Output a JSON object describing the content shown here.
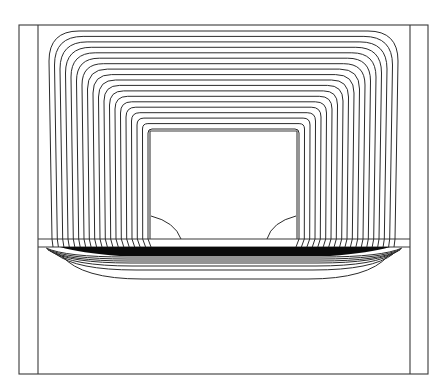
{
  "figure": {
    "type": "flux-contour-diagram",
    "width": 445,
    "height": 389,
    "colors": {
      "background": "#ffffff",
      "line": "#2b2b2b",
      "frame": "#3a3a3a",
      "band": "#0a0a0a"
    },
    "outer_frame": {
      "x1": 19,
      "y1": 25,
      "x2": 428,
      "y2": 374
    },
    "inner_verticals": {
      "left_x": 38,
      "right_x": 410
    },
    "window": {
      "x1": 150,
      "y1": 131,
      "x2": 297,
      "y2": 239
    },
    "divider_line_y": 239,
    "plate": {
      "x1": 38,
      "y1": 247,
      "x2": 410,
      "y2": 374
    },
    "upper_contours": {
      "count": 19,
      "outer": {
        "x1": 49,
        "y1": 31,
        "x2": 398,
        "corner_r": 30
      },
      "inner": {
        "x1": 148,
        "y1": 129,
        "x2": 299,
        "corner_r": 4
      },
      "bottom_y": 239
    },
    "band": {
      "x1": 120,
      "y1": 247,
      "x2": 330,
      "y2": 256
    },
    "lower_contours": [
      {
        "y_center": 257,
        "x_left": 46,
        "x_right": 402,
        "y_edge": 248
      },
      {
        "y_center": 259,
        "x_left": 47,
        "x_right": 401,
        "y_edge": 249
      },
      {
        "y_center": 261,
        "x_left": 48,
        "x_right": 400,
        "y_edge": 250
      },
      {
        "y_center": 263,
        "x_left": 50,
        "x_right": 398,
        "y_edge": 251
      },
      {
        "y_center": 266,
        "x_left": 52,
        "x_right": 396,
        "y_edge": 252
      },
      {
        "y_center": 270,
        "x_left": 56,
        "x_right": 393,
        "y_edge": 254
      },
      {
        "y_center": 279,
        "x_left": 62,
        "x_right": 388,
        "y_edge": 256
      }
    ],
    "lobes": [
      {
        "side": "left",
        "start": [
          151,
          216
        ],
        "ctrl": [
          175,
          222
        ],
        "end": [
          181,
          239
        ]
      },
      {
        "side": "right",
        "start": [
          296,
          216
        ],
        "ctrl": [
          272,
          222
        ],
        "end": [
          267,
          239
        ]
      }
    ]
  }
}
